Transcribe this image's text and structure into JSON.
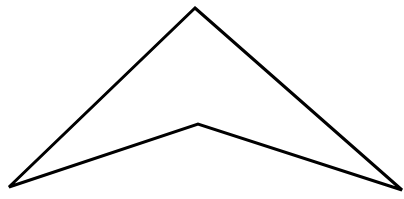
{
  "diagram": {
    "shape": "concave-quadrilateral",
    "background": "#ffffff",
    "stroke": "#000000",
    "stroke_width": 3,
    "vertices": [
      {
        "name": "top",
        "x": 195,
        "y": 8
      },
      {
        "name": "right",
        "x": 402,
        "y": 190
      },
      {
        "name": "inner",
        "x": 198,
        "y": 124
      },
      {
        "name": "left",
        "x": 9,
        "y": 187
      }
    ]
  }
}
